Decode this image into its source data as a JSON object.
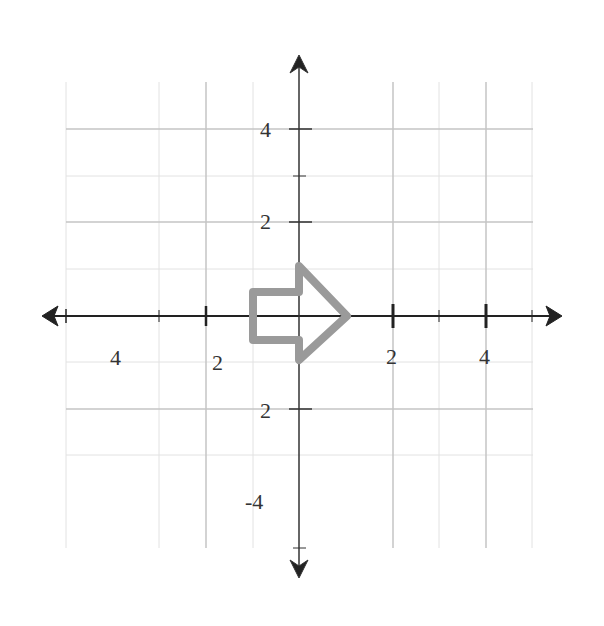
{
  "figure": {
    "type": "coordinate-plane",
    "x_axis": {
      "range": [
        -5,
        5
      ],
      "tick_labels": [
        {
          "value": -4,
          "text": "4"
        },
        {
          "value": -2,
          "text": "2"
        },
        {
          "value": 2,
          "text": "2"
        },
        {
          "value": 4,
          "text": "4"
        }
      ]
    },
    "y_axis": {
      "range": [
        -5,
        5
      ],
      "tick_labels": [
        {
          "value": 4,
          "text": "4"
        },
        {
          "value": 2,
          "text": "2"
        },
        {
          "value": -2,
          "text": "2"
        },
        {
          "value": -4,
          "text": "-4"
        }
      ]
    },
    "shape": {
      "name": "right-pointing arrow",
      "color": "#999999",
      "vertices": [
        [
          -1,
          0.5
        ],
        [
          0,
          0.5
        ],
        [
          0,
          1
        ],
        [
          1.1,
          0
        ],
        [
          0,
          -1
        ],
        [
          0,
          -0.5
        ],
        [
          -1,
          -0.5
        ]
      ]
    },
    "colors": {
      "axis": "#222222",
      "grid": "#bbbbbb",
      "grid_light": "#dddddd",
      "shape": "#999999"
    }
  }
}
